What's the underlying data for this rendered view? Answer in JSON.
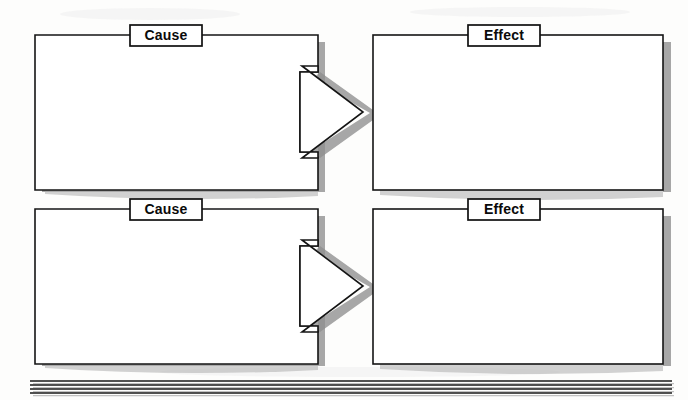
{
  "page": {
    "background_color": "#fdfdfc",
    "ink_color": "#141414",
    "shadow_color": "#8e8e8e",
    "width": 688,
    "height": 400
  },
  "rows": [
    {
      "id": "row-1",
      "cause": {
        "label": "Cause",
        "x": 35,
        "y": 35,
        "width": 283,
        "height": 155
      },
      "arrow": {
        "name": "arrow-right-icon",
        "direction": "right",
        "tip_x": 363,
        "tip_y": 112
      },
      "effect": {
        "label": "Effect",
        "x": 373,
        "y": 35,
        "width": 290,
        "height": 155
      }
    },
    {
      "id": "row-2",
      "cause": {
        "label": "Cause",
        "x": 35,
        "y": 209,
        "width": 283,
        "height": 155
      },
      "arrow": {
        "name": "arrow-right-icon",
        "direction": "right",
        "tip_x": 363,
        "tip_y": 286
      },
      "effect": {
        "label": "Effect",
        "x": 373,
        "y": 209,
        "width": 290,
        "height": 155
      }
    }
  ],
  "footer_rules": {
    "name": "writing-rules",
    "count": 4,
    "x_start": 30,
    "x_end": 672,
    "y_positions": [
      381,
      385,
      389,
      393
    ]
  }
}
